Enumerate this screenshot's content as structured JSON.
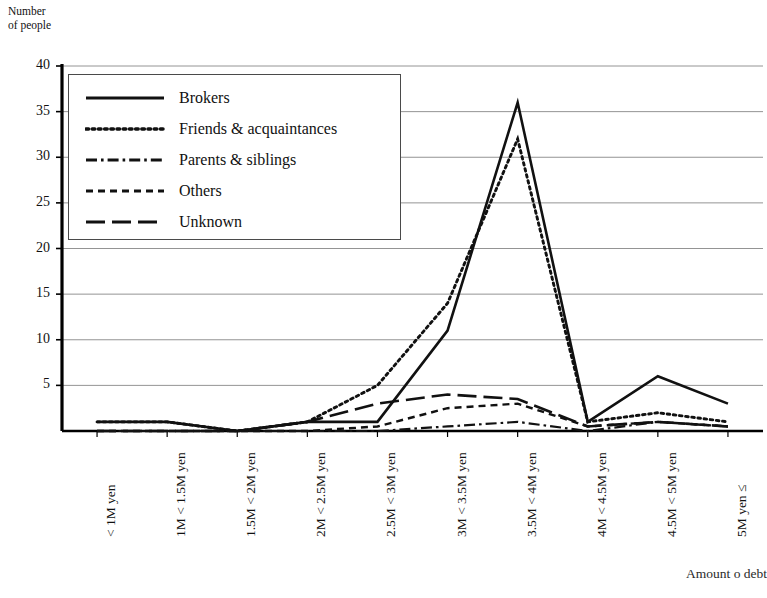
{
  "axis": {
    "y_title": "Number\nof people",
    "x_title": "Amount o debt",
    "y_ticks": [
      "40",
      "35",
      "30",
      "25",
      "20",
      "15",
      "10",
      "5"
    ],
    "x_ticks": [
      "< 1M yen",
      "1M < 1.5M yen",
      "1.5M < 2M yen",
      "2M < 2.5M yen",
      "2.5M < 3M yen",
      "3M < 3.5M yen",
      "3.5M < 4M yen",
      "4M < 4.5M yen",
      "4.5M < 5M yen",
      "5M yen ≤"
    ]
  },
  "legend": {
    "items": [
      {
        "label": "Brokers",
        "dash": "solid"
      },
      {
        "label": "Friends & acquaintances",
        "dash": "dotted"
      },
      {
        "label": "Parents & siblings",
        "dash": "dashdot"
      },
      {
        "label": "Others",
        "dash": "shortdash"
      },
      {
        "label": "Unknown",
        "dash": "longdash"
      }
    ]
  },
  "chart_data": {
    "type": "line",
    "title": "",
    "xlabel": "Amount o debt",
    "ylabel": "Number of people",
    "ylim": [
      0,
      40
    ],
    "ytick_step": 5,
    "grid": "horizontal",
    "legend_position": "upper-left-inside",
    "categories": [
      "< 1M yen",
      "1M < 1.5M yen",
      "1.5M < 2M yen",
      "2M < 2.5M yen",
      "2.5M < 3M yen",
      "3M < 3.5M yen",
      "3.5M < 4M yen",
      "4M < 4.5M yen",
      "4.5M < 5M yen",
      "5M yen ≤"
    ],
    "series": [
      {
        "name": "Brokers",
        "dash": "solid",
        "values": [
          1,
          1,
          0,
          1,
          1,
          11,
          36,
          1,
          6,
          3
        ]
      },
      {
        "name": "Friends & acquaintances",
        "dash": "dotted",
        "values": [
          1,
          1,
          0,
          1,
          5,
          14,
          32,
          1,
          2,
          1
        ]
      },
      {
        "name": "Parents & siblings",
        "dash": "dashdot",
        "values": [
          0,
          0,
          0,
          0,
          0,
          0.5,
          1,
          0,
          1,
          0.5
        ]
      },
      {
        "name": "Others",
        "dash": "shortdash",
        "values": [
          0,
          0,
          0,
          0,
          0.5,
          2.5,
          3,
          0.5,
          1,
          0.5
        ]
      },
      {
        "name": "Unknown",
        "dash": "longdash",
        "values": [
          0,
          0,
          0,
          1,
          3,
          4,
          3.5,
          0.5,
          1,
          0.5
        ]
      }
    ],
    "colors": {
      "line": "#111111",
      "grid": "#888888",
      "axis": "#000000"
    }
  },
  "geometry": {
    "plot_left": 62,
    "plot_right": 763,
    "plot_top": 66,
    "plot_bottom": 431
  }
}
